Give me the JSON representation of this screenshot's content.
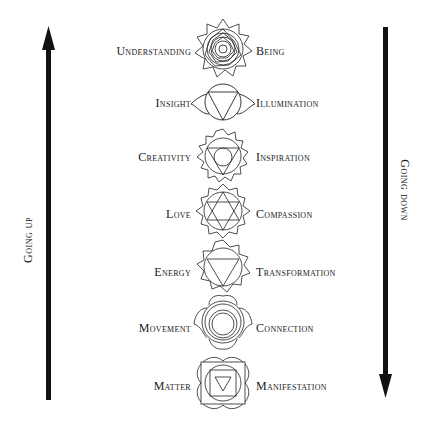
{
  "diagram": {
    "left_axis": {
      "label": "Going up",
      "direction": "up"
    },
    "right_axis": {
      "label": "Going down",
      "direction": "down"
    },
    "levels": [
      {
        "left": "Understanding",
        "right": "Being",
        "icon": "crown-chakra-icon"
      },
      {
        "left": "Insight",
        "right": "Illumination",
        "icon": "third-eye-chakra-icon"
      },
      {
        "left": "Creativity",
        "right": "Inspiration",
        "icon": "throat-chakra-icon"
      },
      {
        "left": "Love",
        "right": "Compassion",
        "icon": "heart-chakra-icon"
      },
      {
        "left": "Energy",
        "right": "Transformation",
        "icon": "solar-plexus-chakra-icon"
      },
      {
        "left": "Movement",
        "right": "Connection",
        "icon": "sacral-chakra-icon"
      },
      {
        "left": "Matter",
        "right": "Manifestation",
        "icon": "root-chakra-icon"
      }
    ],
    "colors": {
      "ink": "#1a1a1a",
      "background": "#ffffff"
    }
  }
}
